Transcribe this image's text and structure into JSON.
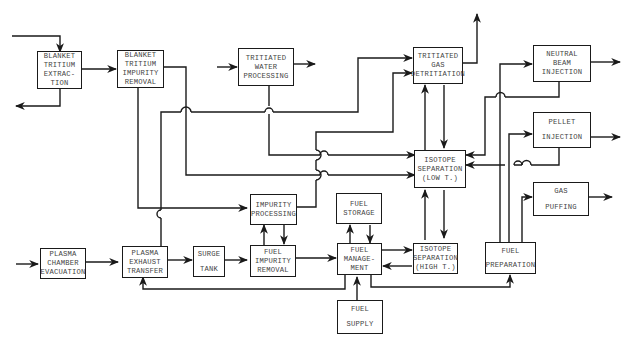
{
  "diagram": {
    "boxes": {
      "blanket_extraction": {
        "lines": [
          "BLANKET",
          "TRITIUM",
          "EXTRAC-",
          "TION"
        ]
      },
      "blanket_impurity": {
        "lines": [
          "BLANKET",
          "TRITIUM",
          "IMPURITY",
          "REMOVAL"
        ]
      },
      "tritiated_water": {
        "lines": [
          "TRITIATED",
          "WATER",
          "PROCESSING"
        ]
      },
      "tritiated_gas": {
        "lines": [
          "TRITIATED",
          "GAS",
          "DETRITIATION"
        ]
      },
      "neutral_beam": {
        "lines": [
          "NEUTRAL",
          "BEAM",
          "INJECTION"
        ]
      },
      "pellet": {
        "lines": [
          "PELLET",
          "INJECTION"
        ]
      },
      "gas_puffing": {
        "lines": [
          "GAS",
          "PUFFING"
        ]
      },
      "isotope_low": {
        "lines": [
          "ISOTOPE",
          "SEPARATION",
          "(LOW T.)"
        ]
      },
      "impurity_processing": {
        "lines": [
          "IMPURITY",
          "PROCESSING"
        ]
      },
      "fuel_storage": {
        "lines": [
          "FUEL",
          "STORAGE"
        ]
      },
      "plasma_evacuation": {
        "lines": [
          "PLASMA",
          "CHAMBER",
          "EVACUATION"
        ]
      },
      "plasma_exhaust": {
        "lines": [
          "PLASMA",
          "EXHAUST",
          "TRANSFER"
        ]
      },
      "surge_tank": {
        "lines": [
          "SURGE",
          "TANK"
        ]
      },
      "fuel_impurity": {
        "lines": [
          "FUEL",
          "IMPURITY",
          "REMOVAL"
        ]
      },
      "fuel_management": {
        "lines": [
          "FUEL",
          "MANAGE-",
          "MENT"
        ]
      },
      "isotope_high": {
        "lines": [
          "ISOTOPE",
          "SEPARATION",
          "(HIGH T.)"
        ]
      },
      "fuel_preparation": {
        "lines": [
          "FUEL",
          "PREPARATION"
        ]
      },
      "fuel_supply": {
        "lines": [
          "FUEL",
          "SUPPLY"
        ]
      }
    }
  }
}
